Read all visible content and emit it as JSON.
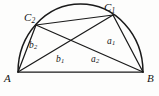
{
  "figure": {
    "background_color": "#fdfdfc",
    "stroke_color": "#1a1a1a",
    "label_color": "#141414",
    "vertices": {
      "A": {
        "label": "A",
        "x": 18,
        "y": 72
      },
      "B": {
        "label": "B",
        "x": 143,
        "y": 72
      },
      "C1": {
        "label": "C",
        "subscript": "1",
        "x": 113,
        "y": 15
      },
      "C2": {
        "label": "C",
        "subscript": "2",
        "x": 36,
        "y": 25
      }
    },
    "sides": {
      "a1": {
        "label": "a",
        "subscript": "1",
        "from": "C1",
        "to": "B"
      },
      "a2": {
        "label": "a",
        "subscript": "2",
        "from": "C2",
        "to": "B"
      },
      "b1": {
        "label": "b",
        "subscript": "1",
        "from": "A",
        "to": "C1"
      },
      "b2": {
        "label": "b",
        "subscript": "2",
        "from": "A",
        "to": "C2"
      }
    },
    "arc": {
      "center_x": 80.5,
      "center_y": 72,
      "radius": 62.5,
      "start_x": 18,
      "start_y": 72,
      "end_x": 143,
      "end_y": 72,
      "apex_y": 4
    },
    "segments": [
      {
        "name": "base-AB",
        "x1": 18,
        "y1": 72,
        "x2": 143,
        "y2": 72
      },
      {
        "name": "side-b2",
        "x1": 18,
        "y1": 72,
        "x2": 36,
        "y2": 25
      },
      {
        "name": "side-b1",
        "x1": 18,
        "y1": 72,
        "x2": 113,
        "y2": 15
      },
      {
        "name": "side-a2",
        "x1": 143,
        "y1": 72,
        "x2": 36,
        "y2": 25
      },
      {
        "name": "side-a1",
        "x1": 143,
        "y1": 72,
        "x2": 113,
        "y2": 15
      },
      {
        "name": "chord-C2C1",
        "x1": 36,
        "y1": 25,
        "x2": 113,
        "y2": 15
      }
    ]
  }
}
